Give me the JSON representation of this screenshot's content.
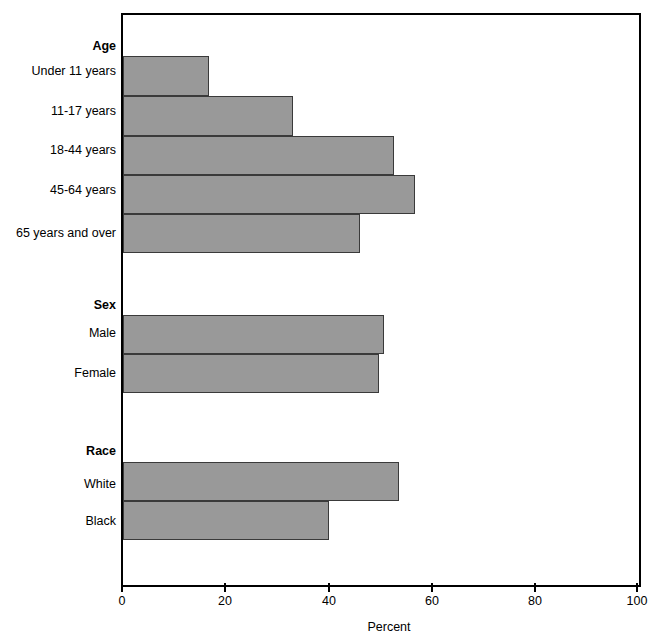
{
  "chart_data": {
    "type": "bar",
    "orientation": "horizontal",
    "title": "",
    "xlabel": "Percent",
    "ylabel": "",
    "xlim": [
      0,
      100
    ],
    "xticks": [
      0,
      20,
      40,
      60,
      80,
      100
    ],
    "xtick_labels": [
      "0",
      "20",
      "40",
      "60",
      "80",
      "100"
    ],
    "grid": false,
    "legend": null,
    "bar_color": "#999999",
    "bar_edge_color": "#3a3a3a",
    "axis_color": "#000000",
    "groups": [
      {
        "name": "Age",
        "categories": [
          "Under 11 years",
          "11-17 years",
          "18-44 years",
          "45-64 years",
          "65 years and over"
        ],
        "values": [
          16.7,
          33.0,
          52.5,
          56.6,
          46.0
        ]
      },
      {
        "name": "Sex",
        "categories": [
          "Male",
          "Female"
        ],
        "values": [
          50.6,
          49.6
        ]
      },
      {
        "name": "Race",
        "categories": [
          "White",
          "Black"
        ],
        "values": [
          53.5,
          39.9
        ]
      }
    ],
    "categories": [
      "Under 11 years",
      "11-17 years",
      "18-44 years",
      "45-64 years",
      "65 years and over",
      "Male",
      "Female",
      "White",
      "Black"
    ],
    "values": [
      16.7,
      33.0,
      52.5,
      56.6,
      46.0,
      50.6,
      49.6,
      53.5,
      39.9
    ]
  },
  "axis": {
    "x_title": "Percent",
    "tick_0": "0",
    "tick_1": "20",
    "tick_2": "40",
    "tick_3": "60",
    "tick_4": "80",
    "tick_5": "100"
  },
  "labels": {
    "age_head": "Age",
    "age_0": "Under 11 years",
    "age_1": "11-17 years",
    "age_2": "18-44 years",
    "age_3": "45-64 years",
    "age_4": "65 years and over",
    "sex_head": "Sex",
    "sex_0": "Male",
    "sex_1": "Female",
    "race_head": "Race",
    "race_0": "White",
    "race_1": "Black"
  }
}
